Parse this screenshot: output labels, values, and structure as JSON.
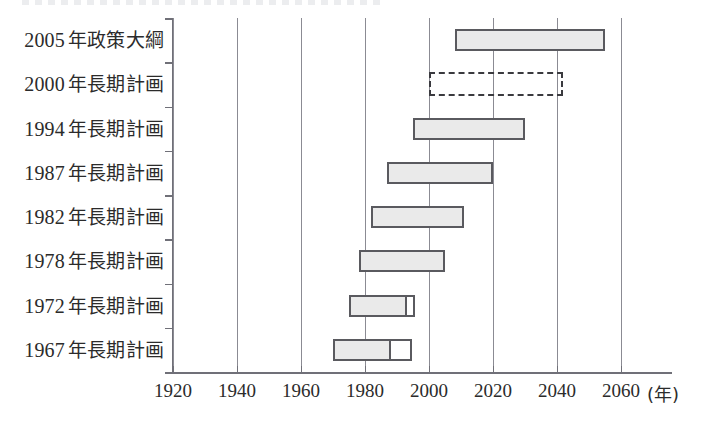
{
  "chart_data": {
    "type": "bar",
    "subtype": "gantt-horizontal-range",
    "title": "",
    "xlabel": "(年)",
    "ylabel": "",
    "xlim": [
      1920,
      2065
    ],
    "xticks": [
      1920,
      1940,
      1960,
      1980,
      2000,
      2020,
      2040,
      2060
    ],
    "xtick_labels": [
      "1920",
      "1940",
      "1960",
      "1980",
      "2000",
      "2020",
      "2040",
      "2060"
    ],
    "x_unit_label": "(年)",
    "grid": "vertical",
    "legend": "none",
    "categories": [
      "2005 年政策大綱",
      "2000 年長期計画",
      "1994 年長期計画",
      "1987 年長期計画",
      "1982 年長期計画",
      "1978 年長期計画",
      "1972 年長期計画",
      "1967 年長期計画"
    ],
    "bars": [
      {
        "label": "2005 年政策大綱",
        "start": 2008,
        "end": 2055,
        "style": "filled",
        "open_start": null,
        "open_end": null
      },
      {
        "label": "2000 年長期計画",
        "start": 2000,
        "end": 2042,
        "style": "dashed",
        "open_start": null,
        "open_end": null
      },
      {
        "label": "1994 年長期計画",
        "start": 1995,
        "end": 2030,
        "style": "filled",
        "open_start": null,
        "open_end": null
      },
      {
        "label": "1987 年長期計画",
        "start": 1987,
        "end": 2020,
        "style": "filled",
        "open_start": null,
        "open_end": null
      },
      {
        "label": "1982 年長期計画",
        "start": 1982,
        "end": 2011,
        "style": "filled",
        "open_start": null,
        "open_end": null
      },
      {
        "label": "1978 年長期計画",
        "start": 1978,
        "end": 2005,
        "style": "filled",
        "open_start": null,
        "open_end": null
      },
      {
        "label": "1972 年長期計画",
        "start": 1975,
        "end": 1995,
        "style": "filled-with-open-tail",
        "open_start": 1992,
        "open_end": 1995
      },
      {
        "label": "1967 年長期計画",
        "start": 1970,
        "end": 1994,
        "style": "filled-with-open-tail",
        "open_start": 1987,
        "open_end": 1994
      }
    ]
  },
  "rows": [
    {
      "year": "2005",
      "suffix": "年政策大綱"
    },
    {
      "year": "2000",
      "suffix": "年長期計画"
    },
    {
      "year": "1994",
      "suffix": "年長期計画"
    },
    {
      "year": "1987",
      "suffix": "年長期計画"
    },
    {
      "year": "1982",
      "suffix": "年長期計画"
    },
    {
      "year": "1978",
      "suffix": "年長期計画"
    },
    {
      "year": "1972",
      "suffix": "年長期計画"
    },
    {
      "year": "1967",
      "suffix": "年長期計画"
    }
  ],
  "axis": {
    "ticks": [
      {
        "label": "1920"
      },
      {
        "label": "1940"
      },
      {
        "label": "1960"
      },
      {
        "label": "1980"
      },
      {
        "label": "2000"
      },
      {
        "label": "2020"
      },
      {
        "label": "2040"
      },
      {
        "label": "2060"
      }
    ],
    "unit": "(年)"
  },
  "colors": {
    "bar_fill": "#eaeaea",
    "bar_border": "#5a5a5f",
    "gridline": "#8b8b93",
    "axis": "#707078",
    "text": "#2b2b2b",
    "background": "#ffffff"
  }
}
